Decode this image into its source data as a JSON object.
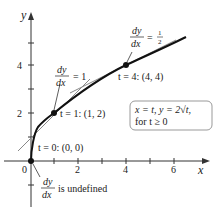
{
  "diagram": {
    "axes": {
      "x_label": "x",
      "y_label": "y",
      "origin_label": "0",
      "x_ticks": [
        "2",
        "4",
        "6"
      ],
      "y_ticks": [
        "2",
        "4"
      ]
    },
    "equation_box": {
      "line1": "x = t, y = 2√t,",
      "line2": "for t ≥ 0"
    },
    "points": [
      {
        "label": "t = 0: (0, 0)",
        "x": 0,
        "y": 0
      },
      {
        "label": "t = 1: (1, 2)",
        "x": 1,
        "y": 2
      },
      {
        "label": "t = 4: (4, 4)",
        "x": 4,
        "y": 4
      }
    ],
    "slope_annotations": [
      {
        "num": "dy",
        "den": "dx",
        "rest": "= 1"
      },
      {
        "num": "dy",
        "den": "dx",
        "rest": "=",
        "frac_num": "1",
        "frac_den": "2"
      },
      {
        "num": "dy",
        "den": "dx",
        "rest": "is undefined"
      }
    ],
    "colors": {
      "curve": "#111111",
      "tangent": "#888888",
      "axis": "#333333",
      "box_border": "#999999"
    }
  }
}
